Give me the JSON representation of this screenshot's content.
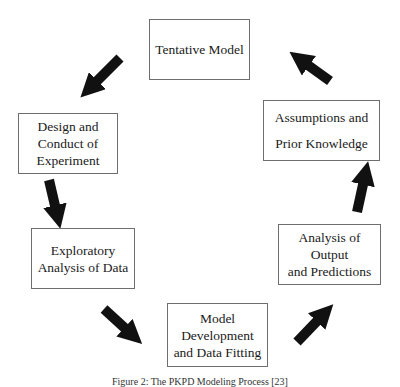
{
  "diagram": {
    "type": "cycle",
    "nodes": [
      {
        "id": "tentative",
        "lines": [
          "Tentative Model"
        ]
      },
      {
        "id": "design",
        "lines": [
          "Design and",
          "Conduct of",
          "Experiment"
        ]
      },
      {
        "id": "exploratory",
        "lines": [
          "Exploratory",
          "Analysis of Data"
        ]
      },
      {
        "id": "model-dev",
        "lines": [
          "Model",
          "Development",
          "and Data Fitting"
        ]
      },
      {
        "id": "analysis",
        "lines": [
          "Analysis of",
          "Output",
          "and Predictions"
        ]
      },
      {
        "id": "assumptions",
        "lines": [
          "Assumptions and",
          "Prior Knowledge"
        ]
      }
    ],
    "edges": [
      {
        "from": "tentative",
        "to": "design"
      },
      {
        "from": "design",
        "to": "exploratory"
      },
      {
        "from": "exploratory",
        "to": "model-dev"
      },
      {
        "from": "model-dev",
        "to": "analysis"
      },
      {
        "from": "analysis",
        "to": "assumptions"
      },
      {
        "from": "assumptions",
        "to": "tentative"
      }
    ],
    "arrow_color": "#111111",
    "border_color": "#6e6e6e"
  },
  "caption": "Figure 2: The PKPD Modeling Process [23]"
}
